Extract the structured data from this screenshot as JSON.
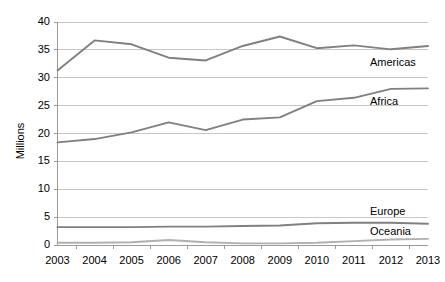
{
  "chart_data": {
    "type": "line",
    "title": "",
    "subtitle": "",
    "xlabel": "",
    "ylabel": "Millions",
    "categories": [
      "2003",
      "2004",
      "2005",
      "2006",
      "2007",
      "2008",
      "2009",
      "2010",
      "2011",
      "2012",
      "2013"
    ],
    "ylim": [
      0,
      40
    ],
    "ytick_labels": [
      "0",
      "5",
      "10",
      "15",
      "20",
      "25",
      "30",
      "35",
      "40"
    ],
    "ytick_values": [
      0,
      5,
      10,
      15,
      20,
      25,
      30,
      35,
      40
    ],
    "grid": true,
    "grid_axis": "y",
    "legend_position": "inline-right-labels",
    "series": [
      {
        "name": "Americas",
        "color": "#808080",
        "values": [
          31.3,
          36.7,
          36.0,
          33.6,
          33.1,
          35.7,
          37.4,
          35.3,
          35.8,
          35.1,
          35.7
        ]
      },
      {
        "name": "Africa",
        "color": "#808080",
        "values": [
          18.4,
          19.0,
          20.2,
          22.0,
          20.6,
          22.5,
          22.9,
          25.8,
          26.4,
          28.0,
          28.1
        ]
      },
      {
        "name": "Europe",
        "color": "#808080",
        "values": [
          3.2,
          3.2,
          3.2,
          3.3,
          3.3,
          3.4,
          3.5,
          3.9,
          4.0,
          4.0,
          3.8
        ]
      },
      {
        "name": "Oceania",
        "color": "#b0b0b0",
        "values": [
          0.4,
          0.4,
          0.5,
          0.9,
          0.5,
          0.3,
          0.3,
          0.4,
          0.7,
          1.0,
          1.1
        ]
      }
    ],
    "series_labels": [
      {
        "text": "Americas",
        "x": 370,
        "y": 57
      },
      {
        "text": "Africa",
        "x": 370,
        "y": 96
      },
      {
        "text": "Europe",
        "x": 370,
        "y": 206
      },
      {
        "text": "Oceania",
        "x": 370,
        "y": 226
      }
    ],
    "colors": {
      "axis": "#9a9a9a",
      "grid": "#c8c8c8",
      "text": "#000000",
      "background": "#ffffff",
      "line_primary": "#808080",
      "line_light": "#b0b0b0"
    }
  }
}
